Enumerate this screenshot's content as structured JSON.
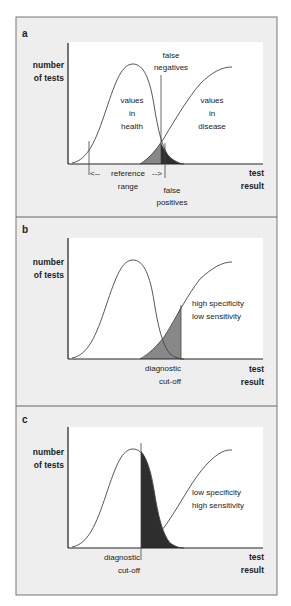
{
  "colors": {
    "panel_bg": "#eeeeee",
    "plot_bg": "#ffffff",
    "border": "#666666",
    "curve": "#444444",
    "false_negative_fill": "#888888",
    "false_positive_fill": "#2e2e2e"
  },
  "panels": [
    {
      "letter": "a",
      "y_label": [
        "number",
        "of tests"
      ],
      "x_label": [
        "test",
        "result"
      ],
      "health_label": [
        "values",
        "in",
        "health"
      ],
      "disease_label": [
        "values",
        "in",
        "disease"
      ],
      "false_negatives_label": [
        "false",
        "negatives"
      ],
      "false_positives_label": [
        "false",
        "positives"
      ],
      "reference_range_label": [
        "reference",
        "range"
      ],
      "arrow_left": "<--",
      "arrow_right": "-->"
    },
    {
      "letter": "b",
      "y_label": [
        "number",
        "of tests"
      ],
      "x_label": [
        "test",
        "result"
      ],
      "annotation": [
        "high specificity",
        "low sensitivity"
      ],
      "cutoff_label": [
        "diagnostic",
        "cut-off"
      ]
    },
    {
      "letter": "c",
      "y_label": [
        "number",
        "of tests"
      ],
      "x_label": [
        "test",
        "result"
      ],
      "annotation": [
        "low specificity",
        "high sensitivity"
      ],
      "cutoff_label": [
        "diagnostic",
        "cut-off"
      ]
    }
  ]
}
